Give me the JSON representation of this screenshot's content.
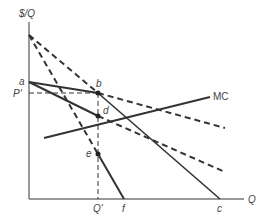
{
  "diagram": {
    "y_axis_label": "$/Q",
    "x_axis_label": "Q",
    "price_label": "P'",
    "quantity_label": "Q'",
    "points": {
      "a": "a",
      "b": "b",
      "d": "d",
      "e": "e",
      "f": "f",
      "c": "c"
    },
    "curve_labels": {
      "mc": "MC"
    },
    "colors": {
      "line": "#333333",
      "axis": "#777777",
      "text": "#444444"
    }
  }
}
